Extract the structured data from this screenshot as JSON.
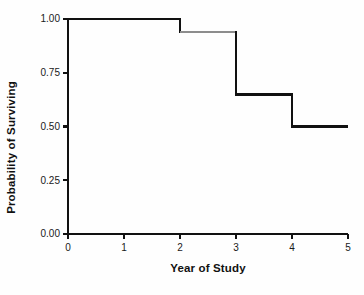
{
  "chart_data": {
    "type": "line",
    "subtype": "kaplan-meier-step",
    "title": "",
    "xlabel": "Year of Study",
    "ylabel": "Probability of Surviving",
    "xlim": [
      0,
      5
    ],
    "ylim": [
      0,
      1
    ],
    "grid": false,
    "legend": null,
    "xticks": [
      "0",
      "1",
      "2",
      "3",
      "4",
      "5"
    ],
    "xtick_values": [
      0,
      1,
      2,
      3,
      4,
      5
    ],
    "yticks": [
      "0.00",
      "0.25",
      "0.50",
      "0.75",
      "1.00"
    ],
    "ytick_values": [
      0.0,
      0.25,
      0.5,
      0.75,
      1.0
    ],
    "series": [
      {
        "name": "Survival probability",
        "step": "post",
        "color": "#111111",
        "linewidth": 2.5,
        "x": [
          0,
          2,
          2,
          3,
          3,
          4,
          4,
          5
        ],
        "y": [
          1.0,
          1.0,
          0.94,
          0.94,
          0.65,
          0.65,
          0.5,
          0.5
        ],
        "steps": [
          {
            "x_start": 0,
            "x_end": 2,
            "value": 1.0,
            "color": "#111111"
          },
          {
            "x_start": 2,
            "x_end": 3,
            "value": 0.94,
            "color": "#8d8d8d"
          },
          {
            "x_start": 3,
            "x_end": 4,
            "value": 0.65,
            "color": "#111111"
          },
          {
            "x_start": 4,
            "x_end": 5,
            "value": 0.5,
            "color": "#111111"
          }
        ],
        "event_times": [
          2,
          3,
          4
        ],
        "event_drops": [
          0.06,
          0.29,
          0.15
        ]
      }
    ]
  },
  "axes": {
    "x_axis_label": "Year of Study",
    "y_axis_label": "Probability of Surviving"
  },
  "colors": {
    "line": "#111111",
    "line_faded": "#8d8d8d",
    "axis": "#111111",
    "background": "#fefefe",
    "text": "#1a1a1a"
  }
}
